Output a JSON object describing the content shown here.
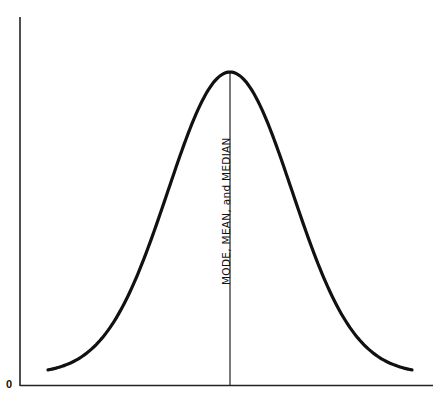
{
  "chart_data": {
    "type": "line",
    "title": "",
    "xlabel": "",
    "ylabel": "",
    "origin_label": "0",
    "annotation": {
      "text": "MODE, MEAN, and MEDIAN",
      "position": "vertical line at center peak"
    },
    "x": [
      -3,
      -2.5,
      -2,
      -1.5,
      -1,
      -0.5,
      0,
      0.5,
      1,
      1.5,
      2,
      2.5,
      3
    ],
    "values": [
      0.011,
      0.044,
      0.135,
      0.325,
      0.607,
      0.882,
      1.0,
      0.882,
      0.607,
      0.325,
      0.135,
      0.044,
      0.011
    ],
    "grid": false,
    "legend": null,
    "colors": {
      "curve": "#111111",
      "axes": "#222222",
      "center_line": "#222222"
    }
  }
}
